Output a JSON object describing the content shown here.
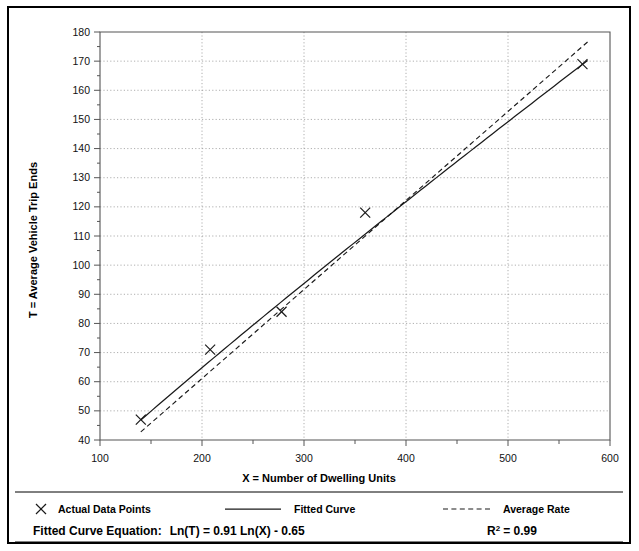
{
  "chart_data": {
    "type": "scatter",
    "title": "",
    "xlabel": "X = Number of Dwelling Units",
    "ylabel": "T = Average Vehicle Trip Ends",
    "xlim": [
      100,
      600
    ],
    "ylim": [
      40,
      180
    ],
    "xticks": [
      100,
      200,
      300,
      400,
      500,
      600
    ],
    "xtick_labels": [
      "100",
      "200",
      "300",
      "400",
      "500",
      "600"
    ],
    "yticks": [
      40,
      50,
      60,
      70,
      80,
      90,
      100,
      110,
      120,
      130,
      140,
      150,
      160,
      170,
      180
    ],
    "ytick_labels": [
      "40",
      "50",
      "60",
      "70",
      "80",
      "90",
      "100",
      "110",
      "120",
      "130",
      "140",
      "150",
      "160",
      "170",
      "180"
    ],
    "xminor_step": 50,
    "yminor_step": 5,
    "grid": true,
    "grid_style": "dotted",
    "legend_position": "below-axes",
    "series": [
      {
        "name": "Actual Data Points",
        "type": "scatter",
        "marker": "x",
        "points": [
          {
            "x": 140,
            "y": 47
          },
          {
            "x": 208,
            "y": 71
          },
          {
            "x": 278,
            "y": 84
          },
          {
            "x": 360,
            "y": 118
          },
          {
            "x": 573,
            "y": 169
          }
        ]
      },
      {
        "name": "Fitted Curve",
        "type": "line",
        "style": "solid",
        "equation": "Ln(T) = 0.91 Ln(X) - 0.65",
        "slope_ln": 0.91,
        "intercept_ln": -0.65,
        "x_start": 140,
        "x_end": 578
      },
      {
        "name": "Average Rate",
        "type": "line",
        "style": "dashed",
        "through_origin": true,
        "rate": 0.3055,
        "x_start": 140,
        "x_end": 578
      }
    ]
  },
  "legend": {
    "items": [
      {
        "label": "Actual Data Points",
        "marker": "x-marker"
      },
      {
        "label": "Fitted Curve",
        "marker": "solid-line"
      },
      {
        "label": "Average Rate",
        "marker": "dashed-line"
      }
    ]
  },
  "footer": {
    "equation_label": "Fitted Curve Equation:",
    "equation_value": "Ln(T) = 0.91 Ln(X) - 0.65",
    "r2_base": "R",
    "r2_exp": "2",
    "r2_value": "= 0.99"
  },
  "colors": {
    "axis": "#555555",
    "grid": "#9a9a9a",
    "line": "#1a1a1a",
    "text": "#000000",
    "border": "#000000",
    "background": "#ffffff"
  }
}
